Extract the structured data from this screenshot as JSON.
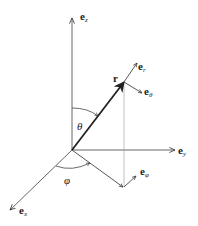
{
  "diagram": {
    "colors": {
      "axis": "#555555",
      "vector": "#222222",
      "dotted": "#999999",
      "text": "#222222"
    },
    "axes": {
      "z": {
        "label_base": "e",
        "label_sub": "z"
      },
      "y": {
        "label_base": "e",
        "label_sub": "y"
      },
      "x": {
        "label_base": "e",
        "label_sub": "x"
      }
    },
    "vectors": {
      "r": {
        "label": "r"
      },
      "e_r": {
        "label_base": "e",
        "label_sub": "r"
      },
      "e_theta": {
        "label_base": "e",
        "label_sub": "θ"
      },
      "e_phi": {
        "label_base": "e",
        "label_sub": "φ"
      }
    },
    "angles": {
      "theta": {
        "label": "θ"
      },
      "phi": {
        "label": "φ"
      }
    }
  }
}
